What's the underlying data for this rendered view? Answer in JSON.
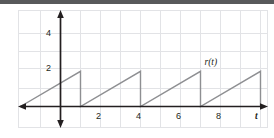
{
  "figure": {
    "background_color": "#ffffff",
    "top_band_color": "#58595b",
    "grid_color": "#e2e3e6",
    "axis_color": "#231f20",
    "curve_color": "#8e8f92"
  },
  "chart_data": {
    "type": "line",
    "title": "",
    "xlabel": "t",
    "ylabel": "",
    "series_label": "r(t)",
    "xlim": [
      -2.1,
      10.25
    ],
    "ylim": [
      -1.2,
      6.6
    ],
    "grid": true,
    "legend": "none",
    "x_ticks": [
      2,
      4,
      6,
      8
    ],
    "x_tick_labels": [
      "2",
      "4",
      "6",
      "8"
    ],
    "y_ticks": [
      2,
      4
    ],
    "y_tick_labels": [
      "2",
      "4"
    ],
    "segments": [
      {
        "x": [
          -2,
          1
        ],
        "y": [
          0,
          2
        ]
      },
      {
        "x": [
          1,
          1
        ],
        "y": [
          2,
          0
        ]
      },
      {
        "x": [
          1,
          4
        ],
        "y": [
          0,
          2
        ]
      },
      {
        "x": [
          4,
          4
        ],
        "y": [
          2,
          0
        ]
      },
      {
        "x": [
          4,
          7
        ],
        "y": [
          0,
          2
        ]
      },
      {
        "x": [
          7,
          7
        ],
        "y": [
          2,
          0
        ]
      },
      {
        "x": [
          7,
          10
        ],
        "y": [
          0,
          2
        ]
      },
      {
        "x": [
          10,
          10
        ],
        "y": [
          2,
          0
        ]
      }
    ],
    "annotations": [
      {
        "text": "r(t)",
        "x": 7.2,
        "y": 2.75
      }
    ]
  },
  "labels": {
    "y_two": "2",
    "y_four": "4",
    "x_two": "2",
    "x_four": "4",
    "x_six": "6",
    "x_eight": "8",
    "axis_t": "t",
    "curve_name": "r(t)"
  }
}
